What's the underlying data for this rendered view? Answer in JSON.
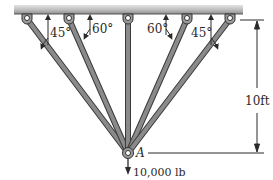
{
  "diagram": {
    "type": "truss-support",
    "ceiling": {
      "color": "#9a9a9a"
    },
    "members": [
      {
        "id": "m1",
        "angle_label": "45°",
        "pin_x": 27
      },
      {
        "id": "m2",
        "angle_label": "60°",
        "pin_x": 69
      },
      {
        "id": "m3",
        "angle_label": "",
        "pin_x": 128
      },
      {
        "id": "m4",
        "angle_label": "60°",
        "pin_x": 187
      },
      {
        "id": "m5",
        "angle_label": "45°",
        "pin_x": 230
      }
    ],
    "joint": {
      "label": "A"
    },
    "load": {
      "label": "10,000 lb"
    },
    "dimension": {
      "label": "10ft"
    },
    "colors": {
      "member": "#8a8a8a",
      "member_edge": "#3a3a3a",
      "line": "#2a2a2a"
    }
  }
}
